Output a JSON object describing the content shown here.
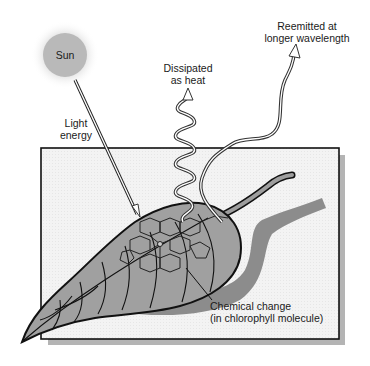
{
  "diagram": {
    "type": "photosynthesis light energy fates",
    "labels": {
      "sun": "Sun",
      "light_energy_line1": "Light",
      "light_energy_line2": "energy",
      "dissipated_line1": "Dissipated",
      "dissipated_line2": "as heat",
      "reemitted_line1": "Reemitted at",
      "reemitted_line2": "longer wavelength",
      "chemical_line1": "Chemical change",
      "chemical_line2": "(in chlorophyll molecule)"
    },
    "colors": {
      "sun_fill": "#b8b8b8",
      "sun_halo": "#d6d6d6",
      "panel_fill": "#f2f2f2",
      "panel_border": "#111111",
      "panel_shadow": "#b0b0b0",
      "leaf_fill": "#9e9e9e",
      "leaf_outline": "#111111",
      "leaf_shadow": "#8a8a8a",
      "wave_stroke": "#333333"
    },
    "elements": [
      {
        "name": "sun",
        "shape": "circle with halo"
      },
      {
        "name": "light-ray",
        "shape": "double straight line from sun into leaf"
      },
      {
        "name": "background-panel",
        "shape": "rectangle with drop shadow"
      },
      {
        "name": "leaf",
        "shape": "leaf with veins, stem, and cast shadow"
      },
      {
        "name": "chlorophyll-molecule",
        "shape": "porphyrin ring network on leaf"
      },
      {
        "name": "heat-wave",
        "shape": "tight wavy arrow upward"
      },
      {
        "name": "reemitted-wave",
        "shape": "long wavy arrow upward-right"
      },
      {
        "name": "chemical-leader",
        "shape": "leader line from molecule to label"
      }
    ]
  }
}
